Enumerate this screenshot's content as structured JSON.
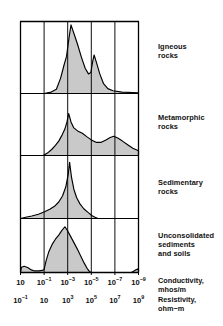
{
  "chart_data": {
    "type": "area",
    "title": "",
    "subtitle": "",
    "xlabel": "",
    "ylabel": "",
    "grid": true,
    "legend_position": "right",
    "orientation": "stacked-panels",
    "x_axes": [
      {
        "name": "Conductivity",
        "unit": "mhos/m",
        "caption": "Conductivity,\nmhos/m",
        "scale": "log",
        "tick_labels": [
          "10",
          "10⁻¹",
          "10⁻³",
          "10⁻⁵",
          "10⁻⁷",
          "10⁻⁹"
        ],
        "tick_mantissas": [
          "10",
          "10",
          "10",
          "10",
          "10",
          "10"
        ],
        "tick_exponents": [
          "",
          "-1",
          "-3",
          "-5",
          "-7",
          "-9"
        ],
        "tick_values": [
          1,
          -1,
          -3,
          -5,
          -7,
          -9
        ]
      },
      {
        "name": "Resistivity",
        "unit": "ohm-m",
        "caption": "Resistivity,\nohm−m",
        "scale": "log",
        "tick_labels": [
          "10⁻¹",
          "10",
          "10³",
          "10⁵",
          "10⁷",
          "10⁹"
        ],
        "tick_mantissas": [
          "10",
          "10",
          "10",
          "10",
          "10",
          "10"
        ],
        "tick_exponents": [
          "-1",
          "",
          "3",
          "5",
          "7",
          "9"
        ],
        "tick_values": [
          -1,
          1,
          3,
          5,
          7,
          9
        ]
      }
    ],
    "x_gridline_positions": [
      0,
      1,
      2,
      3,
      4,
      5
    ],
    "panels": [
      {
        "id": "igneous",
        "label": "Igneous\nrocks",
        "label_lines": [
          "Igneous",
          "rocks"
        ],
        "peak_positions": [
          2.14,
          3.12
        ],
        "points": [
          [
            0.0,
            0.0
          ],
          [
            1.0,
            0.0
          ],
          [
            1.3,
            0.02
          ],
          [
            1.52,
            0.06
          ],
          [
            1.7,
            0.22
          ],
          [
            1.84,
            0.4
          ],
          [
            1.95,
            0.53
          ],
          [
            2.05,
            0.78
          ],
          [
            2.14,
            0.98
          ],
          [
            2.26,
            0.86
          ],
          [
            2.42,
            0.7
          ],
          [
            2.58,
            0.52
          ],
          [
            2.74,
            0.36
          ],
          [
            2.88,
            0.28
          ],
          [
            2.98,
            0.3
          ],
          [
            3.06,
            0.46
          ],
          [
            3.12,
            0.55
          ],
          [
            3.22,
            0.44
          ],
          [
            3.36,
            0.28
          ],
          [
            3.52,
            0.14
          ],
          [
            3.7,
            0.07
          ],
          [
            3.92,
            0.04
          ],
          [
            4.3,
            0.02
          ],
          [
            5.0,
            0.01
          ],
          [
            5.0,
            0.0
          ]
        ]
      },
      {
        "id": "metamorphic",
        "label": "Metamorphic\nrocks",
        "label_lines": [
          "Metamorphic",
          "rocks"
        ],
        "peak_positions": [
          2.04,
          3.95
        ],
        "points": [
          [
            0.0,
            0.0
          ],
          [
            0.96,
            0.0
          ],
          [
            1.14,
            0.04
          ],
          [
            1.32,
            0.1
          ],
          [
            1.48,
            0.17
          ],
          [
            1.62,
            0.24
          ],
          [
            1.76,
            0.34
          ],
          [
            1.88,
            0.44
          ],
          [
            1.97,
            0.56
          ],
          [
            2.04,
            0.7
          ],
          [
            2.14,
            0.56
          ],
          [
            2.26,
            0.46
          ],
          [
            2.42,
            0.41
          ],
          [
            2.62,
            0.37
          ],
          [
            2.82,
            0.31
          ],
          [
            3.0,
            0.26
          ],
          [
            3.2,
            0.22
          ],
          [
            3.42,
            0.22
          ],
          [
            3.62,
            0.26
          ],
          [
            3.8,
            0.3
          ],
          [
            3.95,
            0.32
          ],
          [
            4.12,
            0.29
          ],
          [
            4.32,
            0.24
          ],
          [
            4.54,
            0.18
          ],
          [
            4.76,
            0.12
          ],
          [
            5.0,
            0.08
          ],
          [
            5.0,
            0.0
          ]
        ]
      },
      {
        "id": "sedimentary",
        "label": "Sedimentary\nrocks",
        "label_lines": [
          "Sedimentary",
          "rocks"
        ],
        "peak_positions": [
          2.08
        ],
        "points": [
          [
            0.0,
            0.0
          ],
          [
            0.22,
            0.02
          ],
          [
            0.48,
            0.04
          ],
          [
            0.76,
            0.07
          ],
          [
            1.02,
            0.11
          ],
          [
            1.24,
            0.15
          ],
          [
            1.44,
            0.2
          ],
          [
            1.62,
            0.27
          ],
          [
            1.78,
            0.37
          ],
          [
            1.92,
            0.52
          ],
          [
            2.02,
            0.72
          ],
          [
            2.08,
            0.92
          ],
          [
            2.16,
            0.68
          ],
          [
            2.26,
            0.48
          ],
          [
            2.38,
            0.34
          ],
          [
            2.52,
            0.24
          ],
          [
            2.68,
            0.16
          ],
          [
            2.86,
            0.1
          ],
          [
            3.02,
            0.05
          ],
          [
            3.16,
            0.02
          ],
          [
            3.28,
            0.0
          ],
          [
            5.0,
            0.0
          ]
        ]
      },
      {
        "id": "unconsolidated",
        "label": "Unconsolidated\nsediments\nand soils",
        "label_lines": [
          "Unconsolidated",
          "sediments",
          "and soils"
        ],
        "peak_positions": [
          1.88
        ],
        "points": [
          [
            0.0,
            0.0
          ],
          [
            0.04,
            0.1
          ],
          [
            0.16,
            0.12
          ],
          [
            0.32,
            0.09
          ],
          [
            0.46,
            0.05
          ],
          [
            0.6,
            0.03
          ],
          [
            0.78,
            0.03
          ],
          [
            0.92,
            0.04
          ],
          [
            1.0,
            0.06
          ],
          [
            1.08,
            0.22
          ],
          [
            1.2,
            0.4
          ],
          [
            1.34,
            0.54
          ],
          [
            1.48,
            0.64
          ],
          [
            1.62,
            0.72
          ],
          [
            1.74,
            0.8
          ],
          [
            1.88,
            0.88
          ],
          [
            2.0,
            0.8
          ],
          [
            2.14,
            0.68
          ],
          [
            2.28,
            0.56
          ],
          [
            2.42,
            0.44
          ],
          [
            2.56,
            0.31
          ],
          [
            2.7,
            0.18
          ],
          [
            2.82,
            0.08
          ],
          [
            2.92,
            0.02
          ],
          [
            3.0,
            0.0
          ],
          [
            4.7,
            0.0
          ],
          [
            4.88,
            0.05
          ],
          [
            5.0,
            0.07
          ],
          [
            5.0,
            0.0
          ]
        ]
      }
    ],
    "style": {
      "fill_color": "#c9c9c9",
      "line_color": "#000000",
      "frame_color": "#000000",
      "grid_color": "#000000",
      "background": "#ffffff"
    }
  }
}
